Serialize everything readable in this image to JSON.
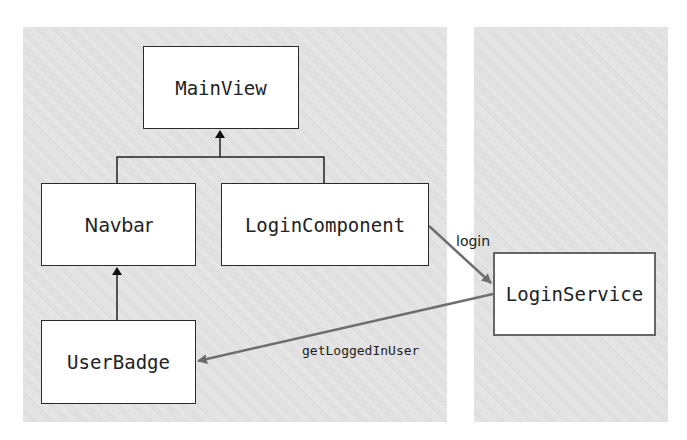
{
  "diagram": {
    "panels": [
      {
        "id": "component-layer",
        "x": 23,
        "y": 27,
        "w": 424,
        "h": 395
      },
      {
        "id": "service-layer",
        "x": 474,
        "y": 27,
        "w": 194,
        "h": 395
      }
    ],
    "nodes": {
      "main_view": {
        "label": "MainView"
      },
      "navbar": {
        "label": "Navbar"
      },
      "login_component": {
        "label": "LoginComponent"
      },
      "user_badge": {
        "label": "UserBadge"
      },
      "login_service": {
        "label": "LoginService"
      }
    },
    "edges": {
      "login": {
        "label": "login",
        "from": "LoginComponent",
        "to": "LoginService"
      },
      "get_logged_in_user": {
        "label": "getLoggedInUser",
        "from": "LoginService",
        "to": "UserBadge"
      },
      "navbar_to_mainview": {
        "from": "Navbar",
        "to": "MainView"
      },
      "logincomponent_to_mainview": {
        "from": "LoginComponent",
        "to": "MainView"
      },
      "userbadge_to_navbar": {
        "from": "UserBadge",
        "to": "Navbar"
      }
    },
    "colors": {
      "panel": "#e3e3e3",
      "box_border": "#2a2a2a",
      "service_arrow": "#6e6e6e"
    }
  }
}
